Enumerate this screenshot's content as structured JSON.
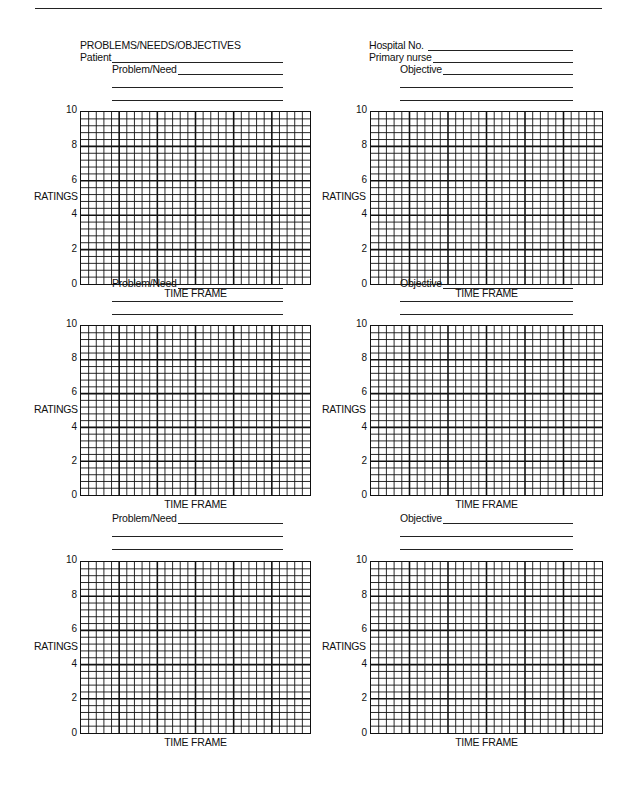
{
  "header": {
    "title": "PROBLEMS/NEEDS/OBJECTIVES",
    "patient_label": "Patient",
    "patient_value": "",
    "hospital_no_label": "Hospital No.",
    "hospital_no_value": "",
    "primary_nurse_label": "Primary nurse",
    "primary_nurse_value": ""
  },
  "charts": [
    {
      "field_label": "Problem/Need",
      "field_value": "",
      "ylabel": "RATINGS",
      "xlabel": "TIME FRAME"
    },
    {
      "field_label": "Objective",
      "field_value": "",
      "ylabel": "RATINGS",
      "xlabel": "TIME FRAME"
    },
    {
      "field_label": "Problem/Need",
      "field_value": "",
      "ylabel": "RATINGS",
      "xlabel": "TIME FRAME"
    },
    {
      "field_label": "Objective",
      "field_value": "",
      "ylabel": "RATINGS",
      "xlabel": "TIME FRAME"
    },
    {
      "field_label": "Problem/Need",
      "field_value": "",
      "ylabel": "RATINGS",
      "xlabel": "TIME FRAME"
    },
    {
      "field_label": "Objective",
      "field_value": "",
      "ylabel": "RATINGS",
      "xlabel": "TIME FRAME"
    }
  ],
  "y_ticks": [
    "10",
    "8",
    "6",
    "4",
    "2",
    "0"
  ],
  "grid": {
    "columns": 30,
    "rows": 25,
    "major_every_col": 5,
    "major_every_row": 5,
    "line_color": "#111111"
  },
  "chart_data": [
    {
      "type": "line",
      "title": "Problem/Need",
      "xlabel": "TIME FRAME",
      "ylabel": "RATINGS",
      "ylim": [
        0,
        10
      ],
      "yticks": [
        0,
        2,
        4,
        6,
        8,
        10
      ],
      "grid": true,
      "series": []
    },
    {
      "type": "line",
      "title": "Objective",
      "xlabel": "TIME FRAME",
      "ylabel": "RATINGS",
      "ylim": [
        0,
        10
      ],
      "yticks": [
        0,
        2,
        4,
        6,
        8,
        10
      ],
      "grid": true,
      "series": []
    },
    {
      "type": "line",
      "title": "Problem/Need",
      "xlabel": "TIME FRAME",
      "ylabel": "RATINGS",
      "ylim": [
        0,
        10
      ],
      "yticks": [
        0,
        2,
        4,
        6,
        8,
        10
      ],
      "grid": true,
      "series": []
    },
    {
      "type": "line",
      "title": "Objective",
      "xlabel": "TIME FRAME",
      "ylabel": "RATINGS",
      "ylim": [
        0,
        10
      ],
      "yticks": [
        0,
        2,
        4,
        6,
        8,
        10
      ],
      "grid": true,
      "series": []
    },
    {
      "type": "line",
      "title": "Problem/Need",
      "xlabel": "TIME FRAME",
      "ylabel": "RATINGS",
      "ylim": [
        0,
        10
      ],
      "yticks": [
        0,
        2,
        4,
        6,
        8,
        10
      ],
      "grid": true,
      "series": []
    },
    {
      "type": "line",
      "title": "Objective",
      "xlabel": "TIME FRAME",
      "ylabel": "RATINGS",
      "ylim": [
        0,
        10
      ],
      "yticks": [
        0,
        2,
        4,
        6,
        8,
        10
      ],
      "grid": true,
      "series": []
    }
  ]
}
